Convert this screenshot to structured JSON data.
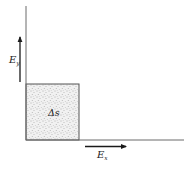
{
  "diagram": {
    "type": "field-component-area",
    "axes": {
      "vertical": {
        "x": 26,
        "y_top": 6,
        "y_bottom": 140
      },
      "horizontal": {
        "y": 140,
        "x_left": 26,
        "x_right": 184
      },
      "color": "#6a6a6a"
    },
    "region": {
      "label": "Δs",
      "x": 26,
      "y": 84,
      "width": 53,
      "height": 56,
      "fill": "#e4e4e4",
      "stroke": "#555555"
    },
    "arrows": {
      "ey": {
        "label_main": "E",
        "label_sub": "y",
        "x": 20,
        "y_start": 82,
        "y_end": 37
      },
      "ex": {
        "label_main": "E",
        "label_sub": "x",
        "y": 146.5,
        "x_start": 85,
        "x_end": 126
      }
    },
    "colors": {
      "arrow": "#1a1a1a",
      "text": "#222222"
    }
  }
}
